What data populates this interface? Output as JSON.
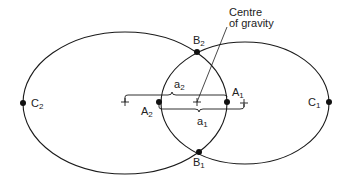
{
  "diagram": {
    "annotation": "Centre of gravity",
    "annotation_lines": [
      "Centre",
      "of gravity"
    ],
    "points": [
      {
        "id": "C2",
        "base": "C",
        "sub": "2"
      },
      {
        "id": "C1",
        "base": "C",
        "sub": "1"
      },
      {
        "id": "B2",
        "base": "B",
        "sub": "2"
      },
      {
        "id": "B1",
        "base": "B",
        "sub": "1"
      },
      {
        "id": "A2",
        "base": "A",
        "sub": "2"
      },
      {
        "id": "A1",
        "base": "A",
        "sub": "1"
      }
    ],
    "distances": [
      {
        "id": "a2",
        "base": "a",
        "sub": "2"
      },
      {
        "id": "a1",
        "base": "a",
        "sub": "1"
      }
    ],
    "colors": {
      "line": "#1a1a1a",
      "background": "#ffffff"
    }
  }
}
